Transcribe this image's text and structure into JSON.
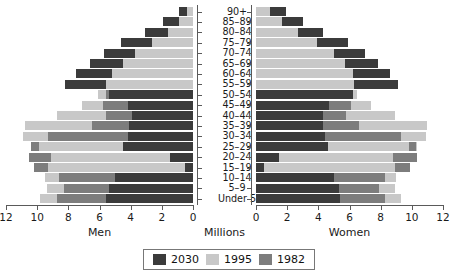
{
  "chart_data": {
    "type": "bar",
    "title": "",
    "subtitle": "",
    "orientation": "horizontal-pyramid",
    "xlabel": "Millions",
    "ylabel": "",
    "left_panel_label": "Men",
    "right_panel_label": "Women",
    "center_label": "Millions",
    "grid": false,
    "legend_position": "bottom-center",
    "xlim_left": [
      12,
      0
    ],
    "xlim_right": [
      0,
      12
    ],
    "left_ticks": [
      "12",
      "10",
      "8",
      "6",
      "4",
      "2",
      "0"
    ],
    "right_ticks": [
      "0",
      "2",
      "4",
      "6",
      "8",
      "10",
      "12"
    ],
    "categories": [
      "90+",
      "85–89",
      "80–84",
      "75–79",
      "70–74",
      "65–69",
      "60–64",
      "55–59",
      "50–54",
      "45–49",
      "40–44",
      "35–39",
      "30–34",
      "25–29",
      "20–24",
      "15–19",
      "10–14",
      "5–9",
      "Under 5"
    ],
    "series": [
      {
        "name": "2030",
        "color": "#3b3b3b",
        "men": [
          0.9,
          1.9,
          3.1,
          4.6,
          5.7,
          6.6,
          7.5,
          8.2,
          5.4,
          4.2,
          3.9,
          4.1,
          4.2,
          4.5,
          1.5,
          0.5,
          5.0,
          5.4,
          5.6
        ],
        "women": [
          1.9,
          3.0,
          4.3,
          5.9,
          7.0,
          7.8,
          8.6,
          9.1,
          6.2,
          4.7,
          4.3,
          4.3,
          4.4,
          4.6,
          1.5,
          0.5,
          5.0,
          5.3,
          5.4
        ]
      },
      {
        "name": "1995",
        "color": "#c8c8c8",
        "men": [
          0.4,
          0.9,
          1.6,
          2.6,
          3.7,
          4.5,
          5.2,
          5.6,
          6.1,
          7.1,
          8.7,
          10.8,
          10.9,
          9.9,
          9.1,
          9.3,
          9.5,
          9.4,
          9.8
        ],
        "women": [
          0.9,
          1.7,
          2.7,
          3.9,
          5.0,
          5.7,
          6.2,
          6.3,
          6.5,
          7.4,
          8.9,
          11.0,
          10.9,
          9.8,
          8.8,
          8.9,
          9.0,
          8.9,
          9.3
        ]
      },
      {
        "name": "1982",
        "color": "#7d7d7d",
        "men": [
          0.2,
          0.5,
          1.0,
          1.8,
          2.9,
          3.9,
          4.7,
          5.2,
          5.6,
          5.8,
          5.6,
          6.5,
          9.3,
          10.4,
          10.5,
          10.2,
          8.6,
          8.3,
          8.7
        ],
        "women": [
          0.5,
          1.0,
          1.9,
          3.0,
          4.2,
          5.2,
          5.9,
          6.1,
          6.2,
          6.1,
          5.8,
          6.6,
          9.3,
          10.3,
          10.3,
          9.9,
          8.3,
          7.9,
          8.3
        ]
      }
    ],
    "legend": [
      {
        "label": "2030",
        "color": "#3b3b3b"
      },
      {
        "label": "1995",
        "color": "#c8c8c8"
      },
      {
        "label": "1982",
        "color": "#7d7d7d"
      }
    ]
  }
}
